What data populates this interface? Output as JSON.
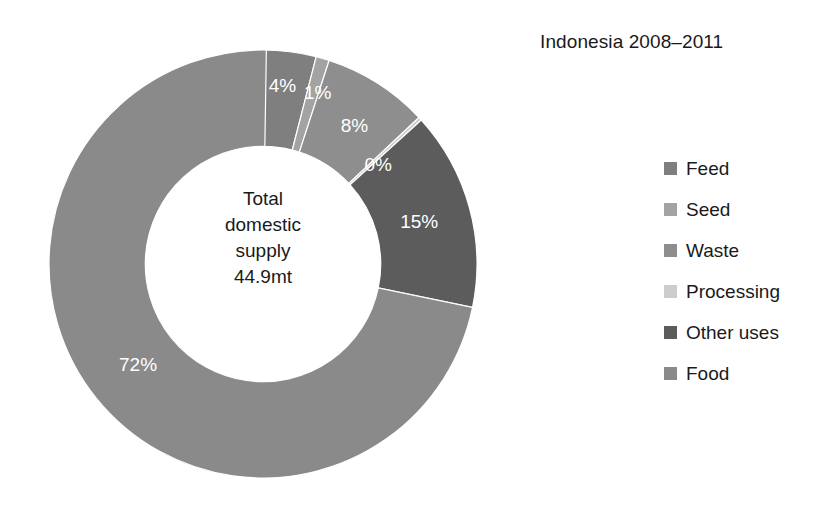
{
  "chart_data": {
    "type": "pie",
    "variant": "donut",
    "title": "Indonesia 2008–2011",
    "xlabel": "",
    "ylabel": "",
    "grid": false,
    "legend_position": "right",
    "center_label": {
      "line1": "Total",
      "line2": "domestic",
      "line3": "supply",
      "line4": "44.9mt",
      "total_value": 44.9,
      "units": "mt"
    },
    "inner_radius_ratio": 0.55,
    "start_angle_deg": 0,
    "direction": "clockwise",
    "categories": [
      "Feed",
      "Seed",
      "Waste",
      "Processing",
      "Other uses",
      "Food"
    ],
    "values": [
      4,
      1,
      8,
      0,
      15,
      72
    ],
    "value_labels": [
      "4%",
      "1%",
      "8%",
      "0%",
      "15%",
      "72%"
    ],
    "colors": [
      "#7f7f7f",
      "#a3a3a3",
      "#8e8e8e",
      "#cccccc",
      "#5c5c5c",
      "#8a8a8a"
    ],
    "slices": [
      {
        "name": "Feed",
        "value": 4,
        "label": "4%",
        "color": "#7f7f7f"
      },
      {
        "name": "Seed",
        "value": 1,
        "label": "1%",
        "color": "#a3a3a3"
      },
      {
        "name": "Waste",
        "value": 8,
        "label": "8%",
        "color": "#8e8e8e"
      },
      {
        "name": "Processing",
        "value": 0,
        "label": "0%",
        "color": "#cccccc"
      },
      {
        "name": "Other uses",
        "value": 15,
        "label": "15%",
        "color": "#5c5c5c"
      },
      {
        "name": "Food",
        "value": 72,
        "label": "72%",
        "color": "#8a8a8a"
      }
    ]
  },
  "legend": {
    "items": [
      {
        "label": "Feed",
        "color": "#7f7f7f"
      },
      {
        "label": "Seed",
        "color": "#a3a3a3"
      },
      {
        "label": "Waste",
        "color": "#8e8e8e"
      },
      {
        "label": "Processing",
        "color": "#cccccc"
      },
      {
        "label": "Other uses",
        "color": "#5c5c5c"
      },
      {
        "label": "Food",
        "color": "#8a8a8a"
      }
    ]
  }
}
